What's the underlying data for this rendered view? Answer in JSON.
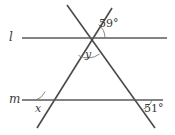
{
  "figure": {
    "background_color": "#ffffff",
    "line_color": "#5a5a5a",
    "text_color": "#3a3a3a",
    "width": 175,
    "height": 135,
    "lines": [
      {
        "id": "line-l",
        "label": "l",
        "orientation": "horizontal",
        "y": 38,
        "x_start": 22,
        "x_end": 167
      },
      {
        "id": "line-m",
        "label": "m",
        "orientation": "horizontal",
        "y": 100,
        "x_start": 22,
        "x_end": 163
      }
    ],
    "transversals": [
      {
        "id": "transversal-left",
        "direction": "up-right",
        "x1": 37,
        "y1": 128,
        "x2": 112,
        "y2": 8
      },
      {
        "id": "transversal-right",
        "direction": "down-right",
        "x1": 67,
        "y1": 5,
        "x2": 155,
        "y2": 128
      }
    ],
    "angles": [
      {
        "id": "angle-59",
        "label": "59°",
        "type": "measure",
        "at": "upper-intersection-right-of-l"
      },
      {
        "id": "angle-y",
        "label": "y",
        "type": "variable",
        "at": "upper-intersection-below-l"
      },
      {
        "id": "angle-x",
        "label": "x",
        "type": "variable",
        "at": "lower-left-intersection-above-m"
      },
      {
        "id": "angle-51",
        "label": "51°",
        "type": "measure",
        "at": "lower-right-intersection-below-m"
      }
    ]
  }
}
